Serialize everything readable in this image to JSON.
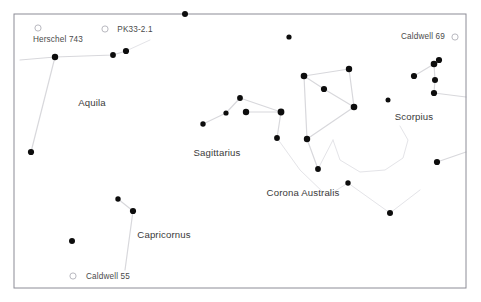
{
  "chart_data": {
    "type": "scatter",
    "title": "",
    "xlabel": "",
    "ylabel": "",
    "xlim": [
      0,
      481
    ],
    "ylim": [
      0,
      302
    ],
    "grid": false,
    "legend": null,
    "frame": {
      "x": 14,
      "y": 14,
      "width": 452,
      "height": 274,
      "stroke": "#8c8c96"
    },
    "colors": {
      "star": "#0d0d0d",
      "line": "#d8d8dc",
      "faint_line": "#e4e4e8",
      "dso_marker": "#b9b9c0",
      "text": "#2b2b2b",
      "frame": "#8c8c96",
      "background": "#ffffff"
    },
    "constellation_labels": [
      {
        "name": "Aquila",
        "text": "Aquila",
        "x": 92,
        "y": 106
      },
      {
        "name": "Sagittarius",
        "text": "Sagittarius",
        "x": 217,
        "y": 156
      },
      {
        "name": "Capricornus",
        "text": "Capricornus",
        "x": 164,
        "y": 238
      },
      {
        "name": "Corona Australis",
        "text": "Corona Australis",
        "x": 303,
        "y": 196
      },
      {
        "name": "Scorpius",
        "text": "Scorpius",
        "x": 414,
        "y": 120
      }
    ],
    "dso_labels": [
      {
        "name": "Herschel 743",
        "text": "Herschel 743",
        "label_x": 58,
        "label_y": 42,
        "marker_x": 38,
        "marker_y": 28,
        "marker_r": 3.1
      },
      {
        "name": "PK33-2.1",
        "text": "PK33-2.1",
        "label_x": 135,
        "label_y": 32,
        "marker_x": 105,
        "marker_y": 29,
        "marker_r": 3.1
      },
      {
        "name": "Caldwell 69",
        "text": "Caldwell 69",
        "label_x": 423,
        "label_y": 39,
        "marker_x": 455,
        "marker_y": 37,
        "marker_r": 3.1
      },
      {
        "name": "Caldwell 55",
        "text": "Caldwell 55",
        "label_x": 108,
        "label_y": 279,
        "marker_x": 73,
        "marker_y": 276,
        "marker_r": 3.1
      }
    ],
    "stars": [
      {
        "x": 185,
        "y": 14,
        "r": 3.0
      },
      {
        "x": 289,
        "y": 37,
        "r": 2.6
      },
      {
        "x": 55,
        "y": 57,
        "r": 3.2
      },
      {
        "x": 113,
        "y": 55,
        "r": 2.9
      },
      {
        "x": 126,
        "y": 51,
        "r": 3.1
      },
      {
        "x": 31,
        "y": 152,
        "r": 3.1
      },
      {
        "x": 240,
        "y": 98,
        "r": 2.9
      },
      {
        "x": 226,
        "y": 113,
        "r": 2.6
      },
      {
        "x": 246,
        "y": 112,
        "r": 3.2
      },
      {
        "x": 203,
        "y": 124,
        "r": 2.7
      },
      {
        "x": 281,
        "y": 112,
        "r": 3.4
      },
      {
        "x": 277,
        "y": 138,
        "r": 2.9
      },
      {
        "x": 304,
        "y": 76,
        "r": 3.3
      },
      {
        "x": 349,
        "y": 69,
        "r": 3.2
      },
      {
        "x": 324,
        "y": 89,
        "r": 3.1
      },
      {
        "x": 354,
        "y": 107,
        "r": 3.3
      },
      {
        "x": 307,
        "y": 139,
        "r": 3.2
      },
      {
        "x": 318,
        "y": 169,
        "r": 2.9
      },
      {
        "x": 348,
        "y": 183,
        "r": 2.7
      },
      {
        "x": 388,
        "y": 100,
        "r": 2.5
      },
      {
        "x": 414,
        "y": 76,
        "r": 3.1
      },
      {
        "x": 434,
        "y": 64,
        "r": 3.3
      },
      {
        "x": 439,
        "y": 60,
        "r": 3.1
      },
      {
        "x": 435,
        "y": 80,
        "r": 3.0
      },
      {
        "x": 434,
        "y": 93,
        "r": 3.1
      },
      {
        "x": 437,
        "y": 162,
        "r": 3.1
      },
      {
        "x": 390,
        "y": 213,
        "r": 3.0
      },
      {
        "x": 118,
        "y": 199,
        "r": 2.7
      },
      {
        "x": 133,
        "y": 211,
        "r": 3.1
      },
      {
        "x": 72,
        "y": 241,
        "r": 3.0
      }
    ],
    "constellation_lines": [
      {
        "name": "aquila-west",
        "points": [
          [
            20,
            60
          ],
          [
            55,
            57
          ]
        ]
      },
      {
        "name": "aquila-spine",
        "points": [
          [
            55,
            57
          ],
          [
            113,
            55
          ],
          [
            126,
            51
          ]
        ]
      },
      {
        "name": "aquila-south",
        "points": [
          [
            55,
            57
          ],
          [
            31,
            152
          ]
        ]
      },
      {
        "name": "sagittarius-handle",
        "points": [
          [
            203,
            124
          ],
          [
            226,
            113
          ],
          [
            240,
            98
          ]
        ]
      },
      {
        "name": "sagittarius-lid",
        "points": [
          [
            240,
            98
          ],
          [
            281,
            112
          ]
        ]
      },
      {
        "name": "sagittarius-body",
        "points": [
          [
            246,
            112
          ],
          [
            281,
            112
          ]
        ]
      },
      {
        "name": "sagittarius-spout",
        "points": [
          [
            281,
            112
          ],
          [
            277,
            138
          ]
        ]
      },
      {
        "name": "teapot-top",
        "points": [
          [
            304,
            76
          ],
          [
            349,
            69
          ]
        ]
      },
      {
        "name": "teapot-left",
        "points": [
          [
            304,
            76
          ],
          [
            324,
            89
          ]
        ]
      },
      {
        "name": "teapot-right",
        "points": [
          [
            349,
            69
          ],
          [
            354,
            107
          ]
        ]
      },
      {
        "name": "teapot-mid",
        "points": [
          [
            324,
            89
          ],
          [
            354,
            107
          ]
        ]
      },
      {
        "name": "teapot-base",
        "points": [
          [
            304,
            76
          ],
          [
            307,
            139
          ]
        ]
      },
      {
        "name": "teapot-bottom",
        "points": [
          [
            307,
            139
          ],
          [
            354,
            107
          ]
        ]
      },
      {
        "name": "teapot-handle",
        "points": [
          [
            307,
            139
          ],
          [
            318,
            169
          ]
        ]
      },
      {
        "name": "scorpius-tail-a",
        "points": [
          [
            414,
            76
          ],
          [
            434,
            64
          ]
        ]
      },
      {
        "name": "scorpius-tail-b",
        "points": [
          [
            434,
            64
          ],
          [
            435,
            80
          ],
          [
            434,
            93
          ]
        ]
      },
      {
        "name": "scorpius-east",
        "points": [
          [
            434,
            93
          ],
          [
            466,
            97
          ]
        ]
      },
      {
        "name": "scorpius-south",
        "points": [
          [
            437,
            162
          ],
          [
            466,
            152
          ]
        ]
      },
      {
        "name": "capricornus-line",
        "points": [
          [
            118,
            199
          ],
          [
            133,
            211
          ]
        ]
      },
      {
        "name": "capricornus-tail",
        "points": [
          [
            133,
            211
          ],
          [
            125,
            270
          ]
        ]
      }
    ],
    "faint_lines": [
      {
        "name": "corona-australis-arc-lead",
        "points": [
          [
            277,
            138
          ],
          [
            300,
            170
          ],
          [
            327,
            196
          ],
          [
            348,
            183
          ]
        ]
      },
      {
        "name": "corona-australis-arc",
        "points": [
          [
            348,
            183
          ],
          [
            390,
            213
          ]
        ]
      },
      {
        "name": "corona-australis-bowl",
        "points": [
          [
            333,
            140
          ],
          [
            340,
            160
          ],
          [
            360,
            172
          ],
          [
            385,
            170
          ],
          [
            403,
            158
          ],
          [
            408,
            140
          ],
          [
            400,
            126
          ]
        ]
      },
      {
        "name": "corona-upper-hook",
        "points": [
          [
            318,
            169
          ],
          [
            333,
            140
          ]
        ]
      },
      {
        "name": "scorpius-link",
        "points": [
          [
            390,
            213
          ],
          [
            420,
            190
          ]
        ]
      },
      {
        "name": "aquila-tail-faint",
        "points": [
          [
            126,
            51
          ],
          [
            150,
            40
          ]
        ]
      }
    ]
  }
}
